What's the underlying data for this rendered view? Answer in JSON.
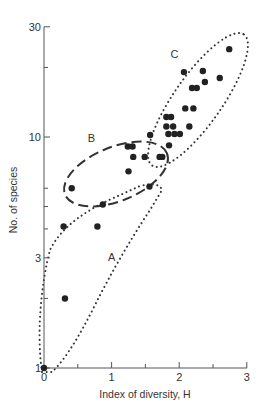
{
  "chart_data": {
    "type": "scatter",
    "title": "",
    "xlabel": "Index of diversity, H",
    "ylabel": "No. of species",
    "xlim": [
      0,
      3
    ],
    "ylim": [
      1,
      30
    ],
    "yscale": "log",
    "grid": false,
    "x_ticks": [
      0,
      1,
      2,
      3
    ],
    "x_tick_labels": [
      "0",
      "1",
      "2",
      "3"
    ],
    "x_minor_ticks": [
      0.5,
      1.5,
      2.5
    ],
    "y_ticks": [
      1,
      3,
      10,
      30
    ],
    "y_tick_labels": [
      "1",
      "3",
      "10",
      "30"
    ],
    "y_minor_ticks": [
      2,
      4,
      5,
      6,
      20
    ],
    "points": [
      {
        "x": 0.0,
        "y": 1.0
      },
      {
        "x": 0.31,
        "y": 2.0
      },
      {
        "x": 0.29,
        "y": 4.1
      },
      {
        "x": 0.79,
        "y": 4.1
      },
      {
        "x": 0.87,
        "y": 5.1
      },
      {
        "x": 0.41,
        "y": 6.0
      },
      {
        "x": 1.25,
        "y": 7.1
      },
      {
        "x": 1.56,
        "y": 6.1
      },
      {
        "x": 1.32,
        "y": 8.2
      },
      {
        "x": 1.49,
        "y": 8.2
      },
      {
        "x": 1.71,
        "y": 8.2
      },
      {
        "x": 1.75,
        "y": 8.2
      },
      {
        "x": 1.24,
        "y": 9.1
      },
      {
        "x": 1.31,
        "y": 9.1
      },
      {
        "x": 1.85,
        "y": 9.2
      },
      {
        "x": 1.57,
        "y": 10.2
      },
      {
        "x": 1.84,
        "y": 10.3
      },
      {
        "x": 1.93,
        "y": 10.3
      },
      {
        "x": 2.01,
        "y": 10.3
      },
      {
        "x": 1.81,
        "y": 11.1
      },
      {
        "x": 1.91,
        "y": 11.1
      },
      {
        "x": 2.15,
        "y": 11.1
      },
      {
        "x": 1.81,
        "y": 12.2
      },
      {
        "x": 1.88,
        "y": 12.2
      },
      {
        "x": 2.09,
        "y": 13.3
      },
      {
        "x": 2.21,
        "y": 13.3
      },
      {
        "x": 2.19,
        "y": 16.3
      },
      {
        "x": 2.26,
        "y": 16.3
      },
      {
        "x": 2.38,
        "y": 17.3
      },
      {
        "x": 2.6,
        "y": 18.0
      },
      {
        "x": 2.07,
        "y": 19.1
      },
      {
        "x": 2.35,
        "y": 19.3
      },
      {
        "x": 2.74,
        "y": 24.0
      }
    ],
    "groups": [
      {
        "label": "A",
        "outline": "dotted",
        "description": "Wedge from origin encompassing low-diversity points"
      },
      {
        "label": "B",
        "outline": "dashed",
        "description": "Ellipse around mid-diversity cluster"
      },
      {
        "label": "C",
        "outline": "dotted",
        "description": "Elongated ellipse around high-diversity cluster"
      }
    ],
    "annotations": [
      {
        "text": "A",
        "x": 1.0,
        "y": 2.9
      },
      {
        "text": "B",
        "x": 0.7,
        "y": 9.5
      },
      {
        "text": "C",
        "x": 1.93,
        "y": 22.0
      }
    ]
  }
}
